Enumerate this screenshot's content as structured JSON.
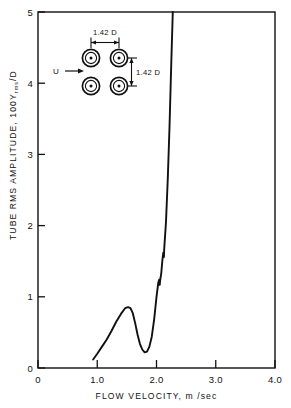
{
  "chart_data": {
    "type": "line",
    "title": "",
    "xlabel": "FLOW  VELOCITY, m /sec",
    "ylabel_main": "TUBE  RMS  AMPLITUDE,  100Y",
    "ylabel_sub": "rms",
    "ylabel_tail": "/D",
    "xlim": [
      0,
      4.0
    ],
    "ylim": [
      0,
      5
    ],
    "grid": false,
    "legend": null,
    "xticks": [
      0,
      1.0,
      2.0,
      3.0,
      4.0
    ],
    "xtick_labels": [
      "0",
      "1.0",
      "2.0",
      "3.0",
      "4.0"
    ],
    "yticks": [
      0,
      1,
      2,
      3,
      4,
      5
    ],
    "ytick_labels": [
      "0",
      "1",
      "2",
      "3",
      "4",
      "5"
    ],
    "series": [
      {
        "name": "tube response",
        "x": [
          0.93,
          1.0,
          1.08,
          1.16,
          1.24,
          1.32,
          1.4,
          1.47,
          1.52,
          1.56,
          1.6,
          1.64,
          1.68,
          1.72,
          1.76,
          1.8,
          1.84,
          1.88,
          1.92,
          1.96,
          2.0,
          2.03,
          2.045,
          2.05,
          2.055,
          2.06,
          2.08,
          2.1,
          2.115,
          2.12,
          2.125,
          2.13,
          2.16,
          2.19,
          2.22,
          2.25,
          2.275
        ],
        "y": [
          0.12,
          0.2,
          0.3,
          0.4,
          0.52,
          0.65,
          0.76,
          0.84,
          0.855,
          0.84,
          0.77,
          0.63,
          0.47,
          0.34,
          0.26,
          0.22,
          0.23,
          0.3,
          0.44,
          0.68,
          1.0,
          1.2,
          1.24,
          1.17,
          1.17,
          1.22,
          1.33,
          1.52,
          1.62,
          1.56,
          1.56,
          1.67,
          2.05,
          2.65,
          3.4,
          4.3,
          5.0
        ]
      }
    ],
    "annotations": {
      "inset_pitch_horizontal": "1.42 D",
      "inset_pitch_vertical": "1.42 D",
      "inset_flow_label": "U",
      "inset_description": "square tube array, 2x2, pitch-to-diameter ratio 1.42"
    },
    "colors": {
      "curve": "#111111",
      "axis": "#111111",
      "background": "#ffffff"
    }
  }
}
